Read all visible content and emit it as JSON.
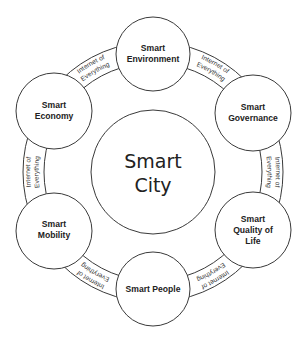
{
  "diagram": {
    "center": {
      "lines": [
        "Smart",
        "City"
      ]
    },
    "nodes": [
      {
        "id": "environment",
        "lines": [
          "Smart",
          "Environment"
        ]
      },
      {
        "id": "governance",
        "lines": [
          "Smart",
          "Governance"
        ]
      },
      {
        "id": "quality-of-life",
        "lines": [
          "Smart",
          "Quality of",
          "Life"
        ]
      },
      {
        "id": "people",
        "lines": [
          "Smart People"
        ]
      },
      {
        "id": "mobility",
        "lines": [
          "Smart",
          "Mobility"
        ]
      },
      {
        "id": "economy",
        "lines": [
          "Smart",
          "Economy"
        ]
      }
    ],
    "connector_label": {
      "line1": "Internet of",
      "line2": "Everything"
    },
    "colors": {
      "stroke": "#3a3a3a",
      "text": "#222222",
      "background": "#ffffff"
    }
  }
}
